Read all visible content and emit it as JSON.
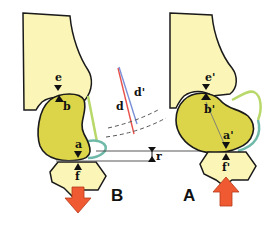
{
  "figure": {
    "panels": [
      {
        "id": "B",
        "label": "B",
        "points": {
          "e": "e",
          "b": "b",
          "a": "a",
          "f": "f"
        },
        "force_direction": "down"
      },
      {
        "id": "A",
        "label": "A",
        "points": {
          "e": "e'",
          "b": "b'",
          "a": "a'",
          "f": "f'"
        },
        "force_direction": "up"
      }
    ],
    "center": {
      "d_label": "d",
      "d_prime_label": "d'",
      "r_label": "r"
    },
    "colors": {
      "bone_light": "#fbf6b8",
      "bone_dark": "#dcd54a",
      "ligament_green": "#b8d86a",
      "ligament_teal": "#6fb9a8",
      "arrow": "#ef5a32",
      "line_red": "#e8504a",
      "line_blue": "#7a8fd6",
      "outline": "#1a1a1a"
    }
  }
}
